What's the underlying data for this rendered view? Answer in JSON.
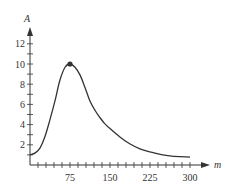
{
  "chart_data": {
    "type": "line",
    "title": "",
    "xlabel": "m",
    "ylabel": "A",
    "xlim": [
      0,
      330
    ],
    "ylim": [
      0,
      13
    ],
    "grid": false,
    "legend": null,
    "x_ticks": [
      75,
      150,
      225,
      300
    ],
    "x_tick_labels": [
      "75",
      "150",
      "225",
      "300"
    ],
    "x_minor_tick_step": 15,
    "y_ticks": [
      2,
      4,
      6,
      8,
      10,
      12
    ],
    "y_tick_labels": [
      "2",
      "4",
      "6",
      "8",
      "10",
      "12"
    ],
    "y_minor_tick_step": 1,
    "series": [
      {
        "name": "A(m)",
        "x": [
          0,
          10,
          19,
          28,
          37,
          47,
          56,
          66,
          75,
          84,
          94,
          103,
          112,
          122,
          131,
          140,
          150,
          168,
          187,
          206,
          225,
          244,
          262,
          281,
          300
        ],
        "y": [
          1.0,
          1.2,
          1.7,
          2.8,
          4.4,
          6.4,
          8.4,
          9.7,
          10.0,
          9.7,
          8.9,
          7.7,
          6.4,
          5.4,
          4.7,
          4.1,
          3.6,
          2.8,
          2.1,
          1.6,
          1.3,
          1.05,
          0.9,
          0.82,
          0.78
        ]
      }
    ],
    "annotations": [
      {
        "type": "point",
        "x": 75,
        "y": 10,
        "label": "maximum"
      }
    ]
  },
  "axes": {
    "x_label": "m",
    "y_label": "A",
    "x_tick_labels": [
      "75",
      "150",
      "225",
      "300"
    ],
    "y_tick_labels": [
      "2",
      "4",
      "6",
      "8",
      "10",
      "12"
    ]
  },
  "colors": {
    "axis": "#333333",
    "curve": "#333333",
    "point": "#333333"
  }
}
